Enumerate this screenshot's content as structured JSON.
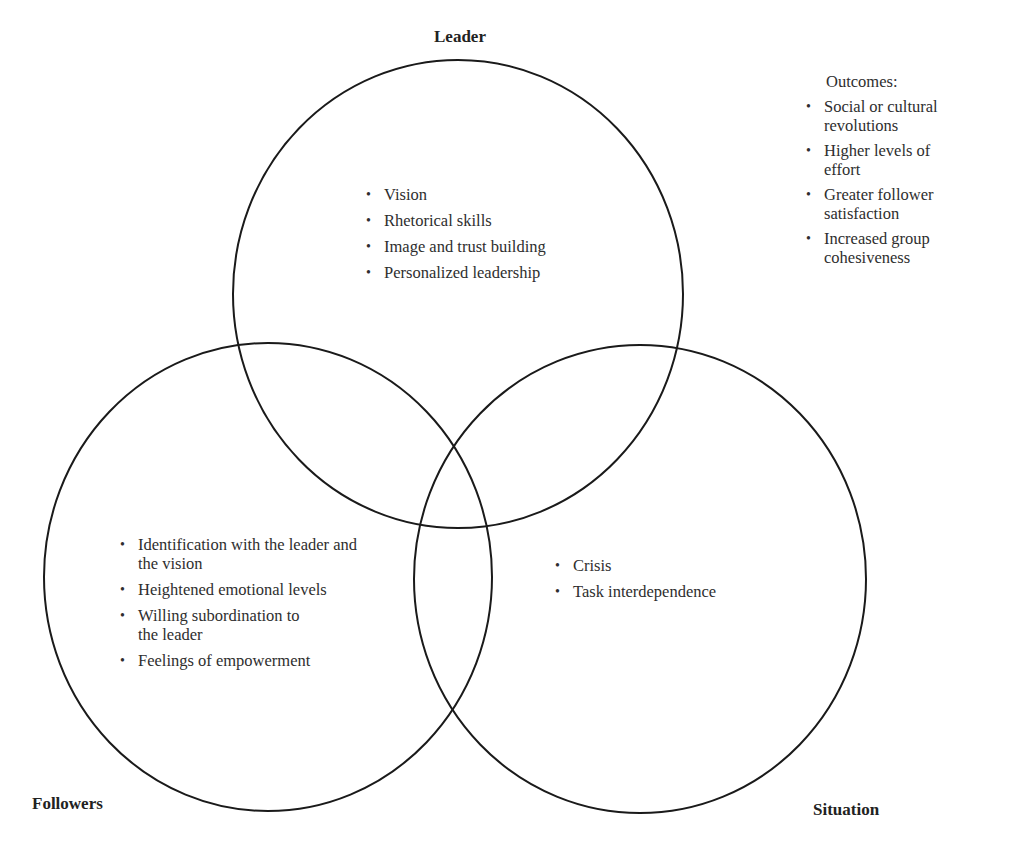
{
  "diagram": {
    "type": "venn",
    "sets": [
      {
        "id": "leader",
        "label": "Leader",
        "items": [
          "Vision",
          "Rhetorical skills",
          "Image and trust building",
          "Personalized leadership"
        ]
      },
      {
        "id": "followers",
        "label": "Followers",
        "items": [
          "Identification with the leader and the vision",
          "Heightened emotional levels",
          "Willing subordination to the leader",
          "Feelings of empowerment"
        ]
      },
      {
        "id": "situation",
        "label": "Situation",
        "items": [
          "Crisis",
          "Task interdependence"
        ]
      }
    ],
    "outcomes": {
      "heading": "Outcomes:",
      "items": [
        "Social or cultural revolutions",
        "Higher levels of effort",
        "Greater follower satisfaction",
        "Increased group cohesiveness"
      ]
    },
    "bullet_glyph": "•",
    "colors": {
      "stroke": "#1a1a1a",
      "text": "#2e2e2e",
      "background": "#ffffff"
    }
  }
}
